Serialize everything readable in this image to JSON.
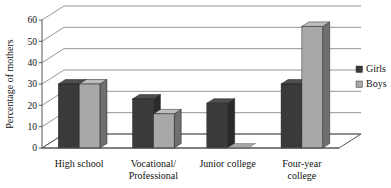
{
  "chart_data": {
    "type": "bar",
    "title": "",
    "subtitle": "",
    "xlabel": "",
    "ylabel": "Percentage of mothers",
    "categories": [
      "High school",
      "Vocational/\nProfessional",
      "Junior college",
      "Four-year\ncollege"
    ],
    "category_lines": [
      [
        "High school"
      ],
      [
        "Vocational/",
        "Professional"
      ],
      [
        "Junior college"
      ],
      [
        "Four-year",
        "college"
      ]
    ],
    "series": [
      {
        "name": "Girls",
        "color": "#3a3a3a",
        "values": [
          30,
          23,
          21,
          30
        ]
      },
      {
        "name": "Boys",
        "color": "#a8a8a8",
        "values": [
          30,
          16,
          0,
          57
        ]
      }
    ],
    "ylim": [
      0,
      60
    ],
    "yticks": [
      0,
      10,
      20,
      30,
      40,
      50,
      60
    ],
    "ytick_labels": [
      "0",
      "10",
      "20",
      "30",
      "40",
      "50",
      "60"
    ],
    "grid": true,
    "grid_axis": "y",
    "legend_position": "right",
    "style": "3d-grouped-bar",
    "colors": {
      "background": "#ffffff",
      "gridline": "#8a8a8a",
      "axis": "#555555",
      "text": "#111111",
      "girls_front": "#3a3a3a",
      "girls_side": "#2a2a2a",
      "girls_top": "#4e4e4e",
      "boys_front": "#a8a8a8",
      "boys_side": "#6f6f6f",
      "boys_top": "#bdbdbd"
    }
  },
  "legend": {
    "items": [
      {
        "label": "Girls",
        "color": "#3a3a3a"
      },
      {
        "label": "Boys",
        "color": "#a8a8a8"
      }
    ]
  },
  "axis": {
    "y_title": "Percentage of mothers",
    "y_tick_labels": [
      "60",
      "50",
      "40",
      "30",
      "20",
      "10",
      "0"
    ]
  }
}
